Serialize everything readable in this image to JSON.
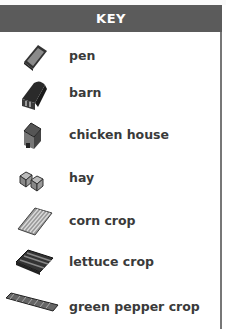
{
  "key": {
    "title": "KEY",
    "header_color": "#5b5b5b",
    "items": [
      {
        "icon": "pen-icon",
        "label": "pen"
      },
      {
        "icon": "barn-icon",
        "label": "barn"
      },
      {
        "icon": "chicken-house-icon",
        "label": "chicken house"
      },
      {
        "icon": "hay-icon",
        "label": "hay"
      },
      {
        "icon": "corn-crop-icon",
        "label": "corn crop"
      },
      {
        "icon": "lettuce-crop-icon",
        "label": "lettuce crop"
      },
      {
        "icon": "green-pepper-crop-icon",
        "label": "green pepper crop"
      }
    ]
  }
}
